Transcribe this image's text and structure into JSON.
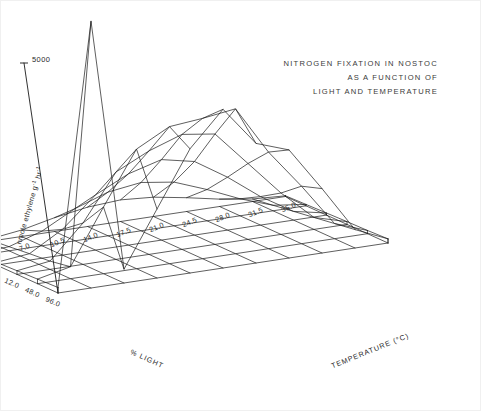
{
  "chart_data": {
    "type": "surface",
    "title": "NITROGEN FIXATION IN NOSTOC AS A FUNCTION OF LIGHT AND TEMPERATURE",
    "title_lines": [
      "NITROGEN FIXATION IN NOSTOC",
      "AS A FUNCTION OF",
      "LIGHT AND TEMPERATURE"
    ],
    "xlabel": "TEMPERATURE (°C)",
    "ylabel": "% LIGHT",
    "zlabel": "nmole ethylene g",
    "zlabel_sup1": "-1",
    "zlabel_mid": " hr",
    "zlabel_sup2": "-1",
    "x_categories": [
      "0",
      "3.5",
      "7.0",
      "10.5",
      "14.0",
      "17.5",
      "21.0",
      "24.5",
      "28.0",
      "31.5",
      "35.0"
    ],
    "x_values": [
      0,
      3.5,
      7.0,
      10.5,
      14.0,
      17.5,
      21.0,
      24.5,
      28.0,
      31.5,
      35.0
    ],
    "y_categories": [
      "96.0",
      "48.0",
      "12.0",
      "3.0",
      ".8",
      ".2"
    ],
    "y_values": [
      96.0,
      48.0,
      12.0,
      3.0,
      0.8,
      0.2
    ],
    "z_ticks": [
      "5000"
    ],
    "z_tick_values": [
      5000
    ],
    "zlim": [
      0,
      6000
    ],
    "grid": false,
    "legend": false,
    "surface_z": [
      [
        120,
        5800,
        300,
        1500,
        2700,
        3450,
        2600,
        2350,
        1400,
        400,
        90
      ],
      [
        100,
        260,
        1450,
        2600,
        2980,
        3050,
        3150,
        2100,
        1250,
        330,
        70
      ],
      [
        80,
        180,
        900,
        1900,
        2250,
        2500,
        2400,
        1650,
        900,
        260,
        60
      ],
      [
        60,
        140,
        560,
        1200,
        1550,
        1750,
        1600,
        1150,
        620,
        190,
        45
      ],
      [
        40,
        90,
        320,
        700,
        950,
        1050,
        950,
        680,
        370,
        120,
        30
      ],
      [
        20,
        45,
        140,
        300,
        420,
        470,
        420,
        300,
        160,
        55,
        15
      ]
    ]
  }
}
